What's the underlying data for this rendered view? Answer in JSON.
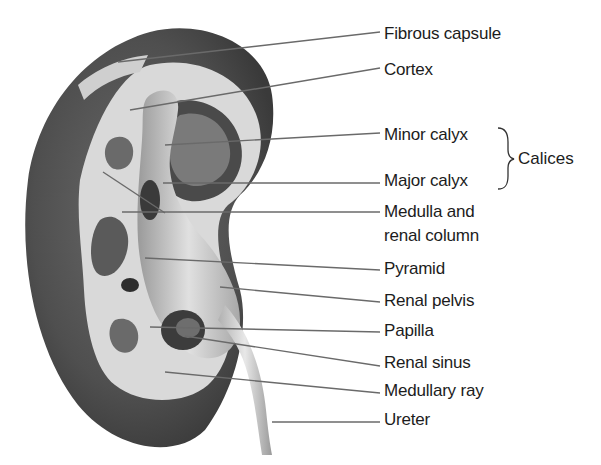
{
  "figure": {
    "labels": [
      {
        "text": "Fibrous capsule",
        "x": 384,
        "y": 25
      },
      {
        "text": "Cortex",
        "x": 384,
        "y": 61
      },
      {
        "text": "Minor calyx",
        "x": 384,
        "y": 126
      },
      {
        "text": "Major calyx",
        "x": 384,
        "y": 172
      },
      {
        "text": "Medulla and",
        "x": 384,
        "y": 203
      },
      {
        "text": "renal column",
        "x": 384,
        "y": 227
      },
      {
        "text": "Pyramid",
        "x": 384,
        "y": 260
      },
      {
        "text": "Renal pelvis",
        "x": 384,
        "y": 292
      },
      {
        "text": "Papilla",
        "x": 384,
        "y": 322
      },
      {
        "text": "Renal sinus",
        "x": 384,
        "y": 354
      },
      {
        "text": "Medullary ray",
        "x": 384,
        "y": 382
      },
      {
        "text": "Ureter",
        "x": 384,
        "y": 411
      }
    ],
    "group": {
      "text": "Calices",
      "members": [
        "Minor calyx",
        "Major calyx"
      ]
    }
  }
}
